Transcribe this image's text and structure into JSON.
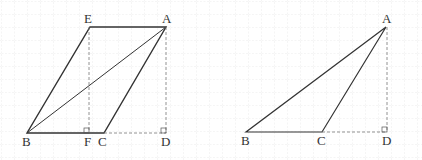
{
  "figure_left": {
    "labels": {
      "E": "E",
      "A": "A",
      "B": "B",
      "F": "F",
      "C": "C",
      "D": "D"
    }
  },
  "figure_right": {
    "labels": {
      "A": "A",
      "B": "B",
      "C": "C",
      "D": "D"
    }
  },
  "colors": {
    "line": "#333333",
    "grid": "#e4e4e4",
    "dashed": "#777777"
  }
}
